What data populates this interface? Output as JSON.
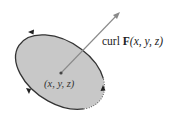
{
  "diagram": {
    "curl_label": {
      "prefix": "curl ",
      "vector": "F",
      "args": "(x, y, z)"
    },
    "point_label": "(x, y, z)",
    "colors": {
      "surface_fill": "#c8c8c8",
      "boundary": "#333333",
      "arrow": "#8a8a8a",
      "text": "#222222"
    },
    "elements": [
      "tilted elliptical disk surface (gray)",
      "oriented boundary curve with three arrowheads (counterclockwise)",
      "center point (x, y, z)",
      "normal vector arrow labeled curl F(x, y, z)"
    ]
  }
}
